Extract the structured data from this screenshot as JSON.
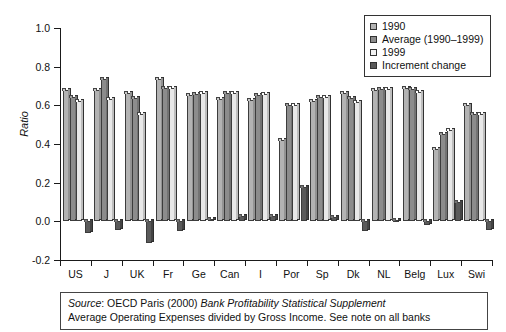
{
  "chart_data": {
    "type": "bar",
    "title": "",
    "subtitle": "",
    "xlabel": "",
    "ylabel": "Ratio",
    "ylim": [
      -0.2,
      1.0
    ],
    "ytick_labels": [
      "1.0",
      "0.8",
      "0.6",
      "0.4",
      "0.2",
      "0.0",
      "-0.2"
    ],
    "ytick_values": [
      1.0,
      0.8,
      0.6,
      0.4,
      0.2,
      0.0,
      -0.2
    ],
    "grid": false,
    "legend_position": "top-right",
    "categories": [
      "US",
      "J",
      "UK",
      "Fr",
      "Ge",
      "Can",
      "I",
      "Por",
      "Sp",
      "Dk",
      "NL",
      "Belg",
      "Lux",
      "Swi"
    ],
    "series": [
      {
        "name": "1990",
        "color": "#b3b3b3",
        "values": [
          0.68,
          0.68,
          0.665,
          0.735,
          0.655,
          0.635,
          0.63,
          0.42,
          0.625,
          0.665,
          0.68,
          0.69,
          0.375,
          0.6
        ]
      },
      {
        "name": "Average (1990–1999)",
        "color": "#8c8c8c",
        "values": [
          0.645,
          0.735,
          0.64,
          0.69,
          0.66,
          0.665,
          0.655,
          0.6,
          0.645,
          0.64,
          0.685,
          0.685,
          0.45,
          0.555
        ]
      },
      {
        "name": "1999",
        "color": "#e8e8e8",
        "values": [
          0.62,
          0.635,
          0.555,
          0.69,
          0.665,
          0.665,
          0.66,
          0.6,
          0.645,
          0.615,
          0.685,
          0.67,
          0.475,
          0.555
        ]
      },
      {
        "name": "Increment change",
        "color": "#5a5a5a",
        "values": [
          -0.06,
          -0.045,
          -0.11,
          -0.05,
          0.01,
          0.03,
          0.03,
          0.18,
          0.02,
          -0.05,
          0.005,
          -0.02,
          0.1,
          -0.045
        ]
      }
    ]
  },
  "legend": {
    "items": [
      {
        "label": "1990",
        "color": "#b3b3b3"
      },
      {
        "label": "Average (1990–1999)",
        "color": "#8c8c8c"
      },
      {
        "label": "1999",
        "color": "#f2f2f2"
      },
      {
        "label": "Increment change",
        "color": "#5a5a5a"
      }
    ]
  },
  "source_note": {
    "line1_prefix": "Source",
    "line1_mid": ": OECD Paris (2000) ",
    "line1_italic": "Bank Profitability Statistical Supplement",
    "line2": "Average Operating Expenses divided by Gross Income. See note on all banks"
  },
  "colors": {
    "axis": "#1a1a1a",
    "bar_outline": "#3c3c3c",
    "background": "#ffffff"
  }
}
